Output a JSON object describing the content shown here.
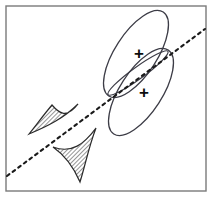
{
  "figure": {
    "background_color": "#ffffff",
    "frame": {
      "name": "plot-frame",
      "color": "#7a7a7a",
      "stroke_width": 1.4,
      "x": 6,
      "y": 6,
      "width": 200,
      "height": 185
    },
    "decision_line": {
      "name": "projection-axis",
      "style": "dashed",
      "color": "#1a1a1a",
      "stroke_width": 2.1,
      "dash_pattern": "3 4",
      "x1": 7,
      "y1": 176,
      "x2": 205,
      "y2": 29
    },
    "ellipses": [
      {
        "name": "upper-cluster-ellipse",
        "cx": 136,
        "cy": 54,
        "rx": 50,
        "ry": 21,
        "rotation": -57,
        "color": "#3c3c46",
        "stroke_width": 1.3,
        "fill": "none"
      },
      {
        "name": "lower-cluster-ellipse",
        "cx": 141,
        "cy": 92,
        "rx": 50,
        "ry": 21,
        "rotation": -57,
        "color": "#3c3c46",
        "stroke_width": 1.3,
        "fill": "none"
      },
      {
        "name": "projected-overlap-lens",
        "cx": 138,
        "cy": 73,
        "rx": 37,
        "ry": 6,
        "rotation": -36,
        "color": "#3c3c46",
        "stroke_width": 1.2,
        "fill": "none"
      }
    ],
    "class_markers": [
      {
        "name": "class-mean-marker-upper",
        "label": "+",
        "x": 139,
        "y": 53
      },
      {
        "name": "class-mean-marker-lower",
        "label": "+",
        "x": 144,
        "y": 92
      }
    ],
    "hatched_distributions": [
      {
        "name": "projected-density-curve-left",
        "color": "#2b2b2b",
        "stroke_width": 1.2,
        "hatch_angle": 45,
        "path": "M 78 104 C 64 118, 48 126, 29 134 C 40 120, 46 112, 52 105 C 58 112, 66 120, 78 104 Z"
      },
      {
        "name": "projected-density-curve-right",
        "color": "#2b2b2b",
        "stroke_width": 1.2,
        "hatch_angle": 45,
        "path": "M 96 128 C 84 144, 72 154, 53 147 C 66 156, 74 168, 80 182 C 85 166, 89 146, 96 128 Z"
      }
    ]
  }
}
